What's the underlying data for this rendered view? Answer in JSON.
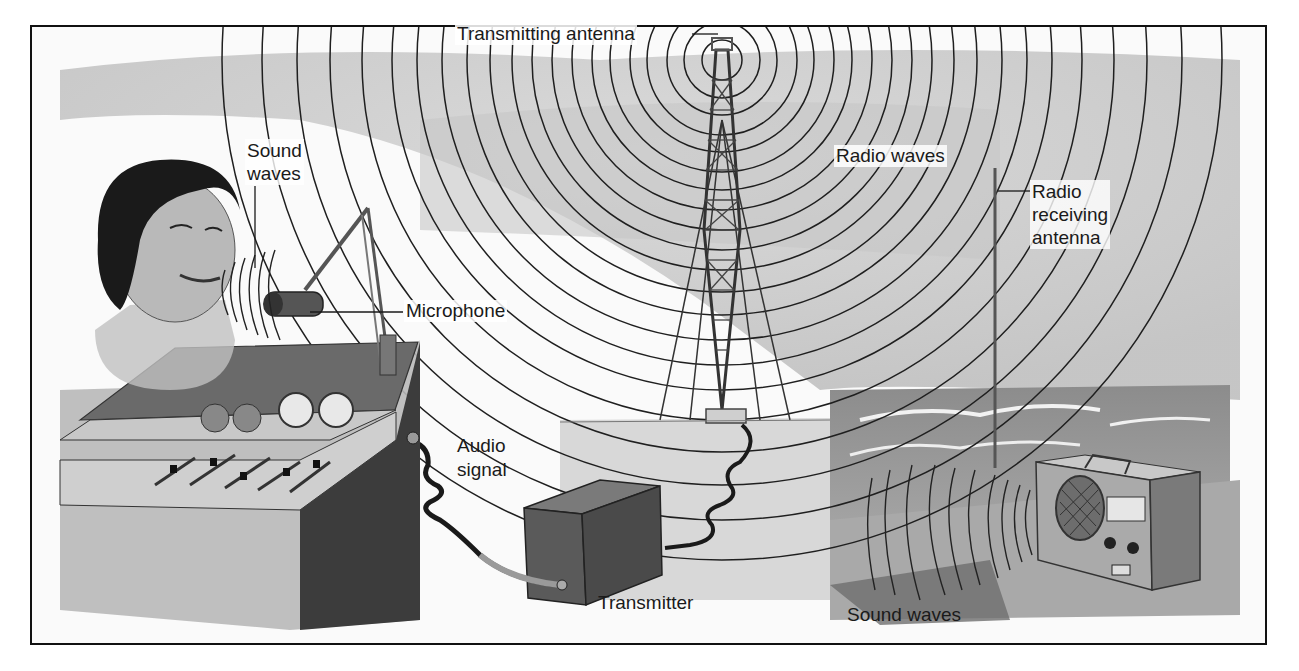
{
  "diagram": {
    "labels": {
      "transmitting_antenna": "Transmitting antenna",
      "sound_waves_top": [
        "Sound",
        "waves"
      ],
      "microphone": "Microphone",
      "radio_waves": "Radio waves",
      "radio_receiving_antenna": [
        "Radio",
        "receiving",
        "antenna"
      ],
      "audio_signal": [
        "Audio",
        "signal"
      ],
      "transmitter": "Transmitter",
      "sound_waves_bottom": "Sound waves"
    },
    "components": [
      "announcer",
      "microphone",
      "mixing-console",
      "audio-cable",
      "transmitter-box",
      "antenna-cable",
      "transmitting-tower",
      "radio-waves",
      "ocean",
      "beach",
      "portable-radio-receiver",
      "receiving-antenna",
      "speaker-sound-waves"
    ],
    "colors": {
      "line": "#1a1a1a",
      "sky": "#cfcfcf",
      "sea": "#9a9a9a",
      "console_dark": "#4a4a4a",
      "console_light": "#bdbdbd",
      "box": "#5a5a5a",
      "radio": "#a8a8a8"
    }
  }
}
